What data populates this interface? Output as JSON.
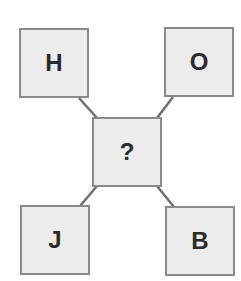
{
  "diagram": {
    "type": "letter-puzzle",
    "center": {
      "label": "?"
    },
    "corners": {
      "top_left": {
        "label": "H"
      },
      "top_right": {
        "label": "O"
      },
      "bottom_left": {
        "label": "J"
      },
      "bottom_right": {
        "label": "B"
      }
    },
    "colors": {
      "box_fill": "#ececec",
      "box_border": "#8a8a8a",
      "connector": "#6e6e6e",
      "text": "#2a2a2a"
    }
  }
}
